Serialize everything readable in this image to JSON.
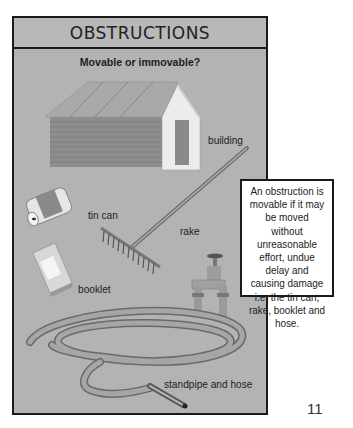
{
  "page": {
    "title": "OBSTRUCTIONS",
    "subtitle": "Movable or immovable?",
    "page_number": "11"
  },
  "illustration": {
    "labels": {
      "building": "building",
      "tin_can": "tin can",
      "rake": "rake",
      "booklet": "booklet",
      "standpipe_and_hose": "standpipe and hose"
    },
    "icons": [
      "building-icon",
      "tin-can-icon",
      "rake-icon",
      "booklet-icon",
      "standpipe-icon",
      "hose-icon"
    ]
  },
  "callout": {
    "text": "An obstruction is movable if it may be moved without unreasonable effort, undue delay and causing damage i.e. the tin can, rake, booklet and hose."
  },
  "colors": {
    "panel_bg": "#b3b3b3",
    "border": "#1a1a1a",
    "callout_bg": "#ffffff"
  }
}
